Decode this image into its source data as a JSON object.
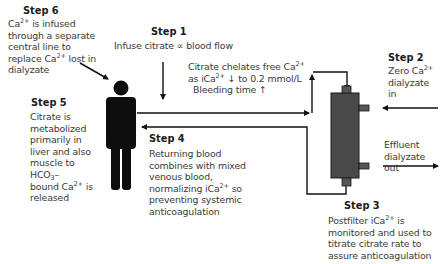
{
  "steps": [
    {
      "id": 1,
      "title": "Step 1",
      "text_parts": [
        "Infuse citrate ∝ blood flow"
      ]
    },
    {
      "id": 2,
      "title": "Step 2",
      "text_parts": [
        "Zero Ca",
        "2+",
        " dialyzate in"
      ]
    },
    {
      "id": 3,
      "title": "Step 3",
      "text_parts": [
        "Postfilter iCa",
        "2+",
        " is monitored and used to titrate citrate rate to assure anticoagulation"
      ]
    },
    {
      "id": 4,
      "title": "Step 4",
      "text_parts": [
        "Returning blood combines with mixed venous blood, normalizing iCa",
        "2+",
        " so preventing systemic anticoagulation"
      ]
    },
    {
      "id": 5,
      "title": "Step 5",
      "text_parts": [
        "Citrate is metabolized primarily in liver and also muscle to HCO",
        "3",
        "– bound Ca",
        "2+",
        " is released"
      ]
    },
    {
      "id": 6,
      "title": "Step 6",
      "text_parts": [
        "Ca",
        "2+",
        " is infused through a separate central line to replace Ca",
        "2+",
        " lost in dialyzate"
      ]
    }
  ],
  "annotations": {
    "chelation": [
      "Citrate chelates free Ca",
      "2+",
      "as iCa",
      "2+",
      " ↓ to 0.2 mmol/L",
      "Bleeding time ↑"
    ],
    "effluent": [
      "Effluent",
      "dialyzate out"
    ]
  },
  "labels": {
    "step2_line1": "Zero Ca",
    "step2_sup": "2+",
    "step2_line2": "dialyzate",
    "step2_line3": "in",
    "step1_text": "Infuse citrate ∝ blood flow",
    "chel_1": "Citrate chelates free Ca",
    "chel_1_sup": "2+",
    "chel_2a": "as iCa",
    "chel_2_sup": "2+",
    "chel_2b": " ↓ to 0.2 mmol/L",
    "chel_3": "Bleeding time ↑",
    "eff_1": "Effluent",
    "eff_2": "dialyzate out",
    "s6_a": "Ca",
    "s6_sup1": "2+",
    "s6_b": " is infused",
    "s6_c": "through a separate",
    "s6_d": "central line to",
    "s6_e": "replace Ca",
    "s6_sup2": "2+",
    "s6_f": " lost in",
    "s6_g": "dialyzate",
    "s5_a": "Citrate is",
    "s5_b": "metabolized",
    "s5_c": "primarily in",
    "s5_d": "liver and also",
    "s5_e": "muscle to",
    "s5_f": "HCO",
    "s5_sub": "3",
    "s5_g": "–",
    "s5_h": "bound Ca",
    "s5_sup": "2+",
    "s5_i": " is",
    "s5_j": "released",
    "s4_a": "Returning blood",
    "s4_b": "combines with mixed",
    "s4_c": "venous blood,",
    "s4_d": "normalizing iCa",
    "s4_sup": "2+",
    "s4_e": " so",
    "s4_f": "preventing systemic",
    "s4_g": "anticoagulation",
    "s3_a": "Postfilter iCa",
    "s3_sup": "2+",
    "s3_b": " is",
    "s3_c": "monitored and used to",
    "s3_d": "titrate citrate rate to",
    "s3_e": "assure anticoagulation"
  },
  "colors": {
    "line": "#111111",
    "dialyzer": "#4a4a4a",
    "person": "#0d0d0d",
    "text": "#3a3a3a"
  }
}
